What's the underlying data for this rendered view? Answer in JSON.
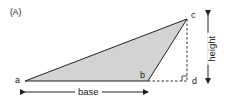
{
  "diagram": {
    "panel_label": "(A)",
    "points": {
      "a": {
        "label": "a",
        "x": 25,
        "y": 81
      },
      "b": {
        "label": "b",
        "x": 148,
        "y": 81
      },
      "c": {
        "label": "c",
        "x": 187,
        "y": 19
      },
      "d": {
        "label": "d",
        "x": 187,
        "y": 81
      }
    },
    "dimensions": {
      "base_label": "base",
      "height_label": "height"
    },
    "colors": {
      "triangle_fill": "#d3d3d3",
      "stroke": "#222222",
      "dashed": "#333333"
    },
    "nodes": [
      {
        "id": "a",
        "label": "a"
      },
      {
        "id": "b",
        "label": "b"
      },
      {
        "id": "c",
        "label": "c"
      },
      {
        "id": "d",
        "label": "d"
      }
    ],
    "edges": [
      {
        "from": "a",
        "to": "b",
        "style": "solid"
      },
      {
        "from": "b",
        "to": "c",
        "style": "solid"
      },
      {
        "from": "c",
        "to": "a",
        "style": "solid"
      },
      {
        "from": "b",
        "to": "d",
        "style": "dashed"
      },
      {
        "from": "c",
        "to": "d",
        "style": "dashed"
      }
    ],
    "annotations": [
      "right-angle marker at d",
      "double arrow for base under a–b",
      "vertical double arrow for height"
    ]
  }
}
